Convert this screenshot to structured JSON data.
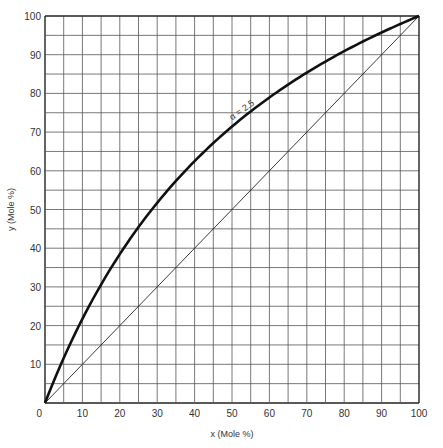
{
  "chart_data": {
    "type": "line",
    "title": "",
    "xlabel": "x (Mole %)",
    "ylabel": "y (Mole %)",
    "xlim": [
      0,
      100
    ],
    "ylim": [
      0,
      100
    ],
    "grid": true,
    "grid_step": 5,
    "xticks": [
      "0",
      "10",
      "20",
      "30",
      "40",
      "50",
      "60",
      "70",
      "80",
      "90",
      "100"
    ],
    "yticks": [
      "10",
      "20",
      "30",
      "40",
      "50",
      "60",
      "70",
      "80",
      "90",
      "100"
    ],
    "annotation": "α = 2.5",
    "series": [
      {
        "name": "Equilibrium curve (α = 2.5)",
        "x": [
          0,
          5,
          10,
          20,
          30,
          40,
          50,
          60,
          70,
          80,
          90,
          100
        ],
        "y": [
          0,
          11.6,
          21.7,
          38.5,
          51.7,
          62.5,
          71.4,
          78.9,
          85.4,
          90.9,
          95.7,
          100
        ]
      },
      {
        "name": "Diagonal y = x",
        "x": [
          0,
          100
        ],
        "y": [
          0,
          100
        ]
      }
    ]
  }
}
